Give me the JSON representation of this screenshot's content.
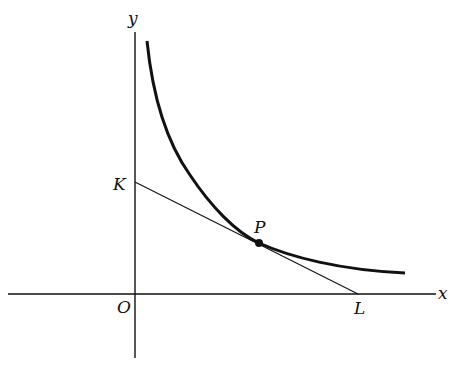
{
  "diagram": {
    "axes": {
      "x_label": "x",
      "y_label": "y",
      "origin_label": "O"
    },
    "points": {
      "K": "K",
      "P": "P",
      "L": "L"
    },
    "colors": {
      "stroke": "#111111",
      "background": "#ffffff"
    }
  }
}
